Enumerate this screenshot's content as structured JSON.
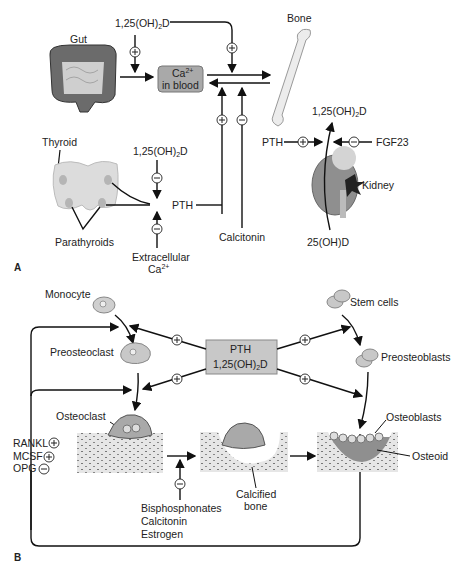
{
  "panel_a": {
    "label": "A",
    "gut": "Gut",
    "bone": "Bone",
    "ca_blood_line1": "Ca",
    "ca_blood_sup": "2+",
    "ca_blood_line2": "in blood",
    "vitd_top": "1,25(OH)",
    "vitd_sub": "2",
    "vitd_d": "D",
    "thyroid": "Thyroid",
    "parathyroids": "Parathyroids",
    "pth": "PTH",
    "extracellular": "Extracellular",
    "ca": "Ca",
    "ca_sup": "2+",
    "calcitonin": "Calcitonin",
    "kidney": "Kidney",
    "fgf23": "FGF23",
    "ohd25": "25(OH)D"
  },
  "panel_b": {
    "label": "B",
    "monocyte": "Monocyte",
    "preosteoclast": "Preosteoclast",
    "osteoclast": "Osteoclast",
    "pth": "PTH",
    "vitd": "1,25(OH)",
    "vitd_sub": "2",
    "vitd_d": "D",
    "stem_cells": "Stem cells",
    "preosteoblasts": "Preosteoblasts",
    "osteoblasts": "Osteoblasts",
    "osteoid": "Osteoid",
    "rankl": "RANKL",
    "mcsf": "MCSF",
    "opg": "OPG",
    "calcified": "Calcified",
    "bone": "bone",
    "inhibitors": [
      "Bisphosphonates",
      "Calcitonin",
      "Estrogen"
    ]
  },
  "colors": {
    "box_gray": "#a9a9a9",
    "box_light": "#c8c8c8",
    "organ_gray": "#d9d9d9",
    "line": "#111111"
  }
}
